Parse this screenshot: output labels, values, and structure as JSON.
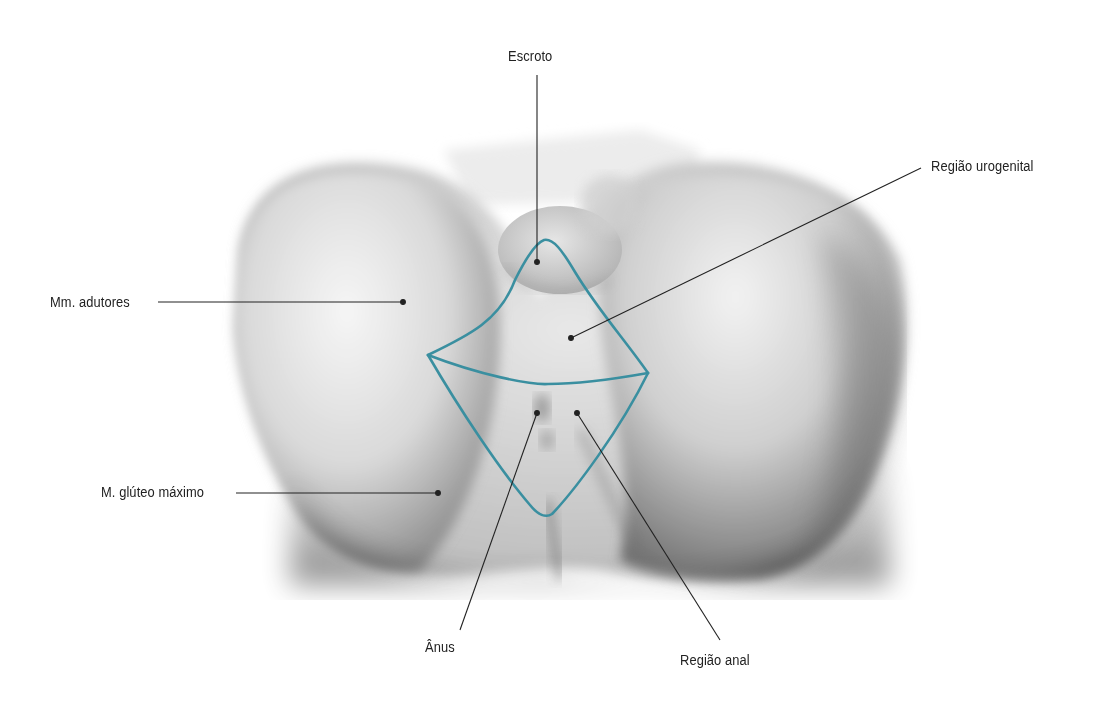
{
  "figure": {
    "type": "anatomical-illustration",
    "view": "inferior view of male perineum",
    "outline_color": "#3a8fa0",
    "leader_color": "#222222",
    "regions": [
      {
        "name": "urogenital-region",
        "label": "Região urogenital"
      },
      {
        "name": "anal-region",
        "label": "Região anal"
      }
    ]
  },
  "labels": {
    "escroto": "Escroto",
    "regiao_urogenital": "Região urogenital",
    "mm_adutores": "Mm. adutores",
    "m_gluteo_maximo": "M. glúteo máximo",
    "anus": "Ânus",
    "regiao_anal": "Região anal"
  }
}
